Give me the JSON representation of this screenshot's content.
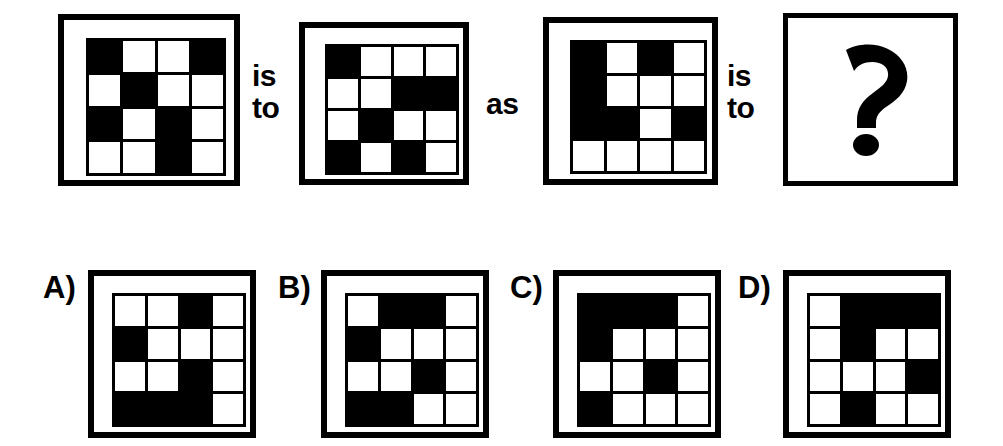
{
  "puzzle": {
    "type": "visual-analogy-matrix",
    "cell_colors": {
      "filled": "#000000",
      "empty": "#ffffff",
      "frame": "#000000",
      "background": "#ffffff"
    },
    "grid_size": "4x4",
    "connectors": {
      "first_line1": "is",
      "first_line2": "to",
      "middle": "as",
      "second_line1": "is",
      "second_line2": "to"
    },
    "question_glyph": "?",
    "stem": [
      {
        "name": "stem-panel-1",
        "cells": [
          [
            1,
            0,
            0,
            1
          ],
          [
            0,
            1,
            0,
            0
          ],
          [
            1,
            0,
            1,
            0
          ],
          [
            0,
            0,
            1,
            0
          ]
        ]
      },
      {
        "name": "stem-panel-2",
        "cells": [
          [
            1,
            0,
            0,
            0
          ],
          [
            0,
            0,
            1,
            1
          ],
          [
            0,
            1,
            0,
            0
          ],
          [
            1,
            0,
            1,
            0
          ]
        ]
      },
      {
        "name": "stem-panel-3",
        "cells": [
          [
            1,
            0,
            1,
            0
          ],
          [
            1,
            0,
            0,
            0
          ],
          [
            1,
            1,
            0,
            1
          ],
          [
            0,
            0,
            0,
            0
          ]
        ]
      }
    ],
    "options": [
      {
        "label": "A)",
        "name": "option-a",
        "cells": [
          [
            0,
            0,
            1,
            0
          ],
          [
            1,
            0,
            0,
            0
          ],
          [
            0,
            0,
            1,
            0
          ],
          [
            1,
            1,
            1,
            0
          ]
        ]
      },
      {
        "label": "B)",
        "name": "option-b",
        "cells": [
          [
            0,
            1,
            1,
            0
          ],
          [
            1,
            0,
            0,
            0
          ],
          [
            0,
            0,
            1,
            0
          ],
          [
            1,
            1,
            0,
            0
          ]
        ]
      },
      {
        "label": "C)",
        "name": "option-c",
        "cells": [
          [
            1,
            1,
            1,
            0
          ],
          [
            1,
            0,
            0,
            0
          ],
          [
            0,
            0,
            1,
            0
          ],
          [
            1,
            0,
            0,
            0
          ]
        ]
      },
      {
        "label": "D)",
        "name": "option-d",
        "cells": [
          [
            0,
            1,
            1,
            1
          ],
          [
            0,
            1,
            0,
            0
          ],
          [
            0,
            0,
            0,
            1
          ],
          [
            0,
            1,
            0,
            0
          ]
        ]
      }
    ]
  }
}
